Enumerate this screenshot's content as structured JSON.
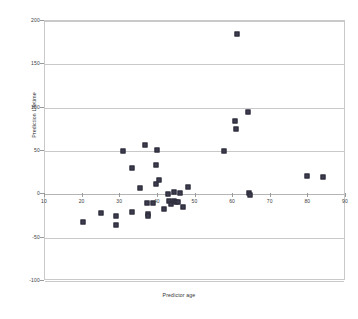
{
  "chart_data": {
    "type": "scatter",
    "title": "",
    "xlabel": "Predictor age",
    "ylabel": "Prediction Lifetime",
    "xlim": [
      10,
      90
    ],
    "ylim": [
      -100,
      200
    ],
    "xticks": [
      10,
      20,
      30,
      40,
      50,
      60,
      70,
      80,
      90
    ],
    "xticklabels": [
      "10",
      "20",
      "30",
      "40",
      "50",
      "60",
      "70",
      "80",
      "90"
    ],
    "yticks": [
      200,
      150,
      100,
      50,
      0,
      -50,
      -100
    ],
    "yticklabels": [
      "200",
      "150",
      "100",
      "50",
      "0",
      "-50",
      "-100"
    ],
    "grid": "horizontal",
    "legend": "none",
    "marker_color": "#3d3d4f",
    "marker_shape": "square",
    "gridline_color": "#c9c9c9",
    "series": [
      {
        "name": "observations",
        "points": [
          [
            20.0,
            -32.0
          ],
          [
            25.0,
            -22.0
          ],
          [
            28.8,
            -25.5
          ],
          [
            29.0,
            -35.5
          ],
          [
            30.8,
            50.0
          ],
          [
            33.0,
            30.0
          ],
          [
            33.2,
            -20.5
          ],
          [
            35.2,
            7.0
          ],
          [
            36.5,
            57.0
          ],
          [
            37.2,
            -10.0
          ],
          [
            37.4,
            -23.0
          ],
          [
            37.5,
            -25.5
          ],
          [
            38.6,
            -10.5
          ],
          [
            39.4,
            11.5
          ],
          [
            39.6,
            34.0
          ],
          [
            39.8,
            51.5
          ],
          [
            40.2,
            16.0
          ],
          [
            41.6,
            -16.5
          ],
          [
            42.6,
            0.5
          ],
          [
            43.0,
            -7.5
          ],
          [
            43.6,
            -11.0
          ],
          [
            44.2,
            -8.0
          ],
          [
            44.4,
            2.5
          ],
          [
            44.8,
            -9.0
          ],
          [
            45.4,
            -8.5
          ],
          [
            45.8,
            1.0
          ],
          [
            46.8,
            -15.0
          ],
          [
            48.0,
            8.0
          ],
          [
            57.5,
            50.5
          ],
          [
            60.5,
            85.0
          ],
          [
            60.7,
            75.0
          ],
          [
            61.0,
            185.0
          ],
          [
            64.0,
            95.0
          ],
          [
            64.2,
            2.0
          ],
          [
            64.4,
            -1.0
          ],
          [
            79.6,
            21.0
          ],
          [
            83.8,
            20.0
          ]
        ]
      }
    ]
  }
}
